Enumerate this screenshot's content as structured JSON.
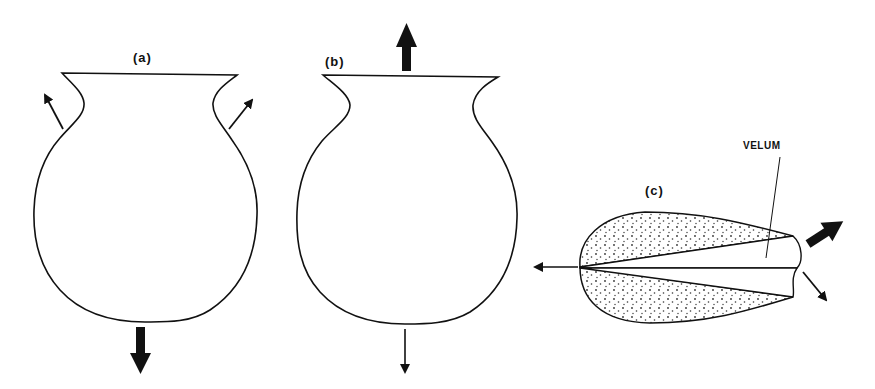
{
  "figure": {
    "panels": [
      {
        "id": "a",
        "label": "(a)"
      },
      {
        "id": "b",
        "label": "(b)"
      },
      {
        "id": "c",
        "label": "(c)"
      }
    ],
    "annotations": {
      "velum": "VELUM"
    },
    "colors": {
      "ink": "#111111",
      "background": "#ffffff",
      "stipple": "#333333"
    }
  }
}
